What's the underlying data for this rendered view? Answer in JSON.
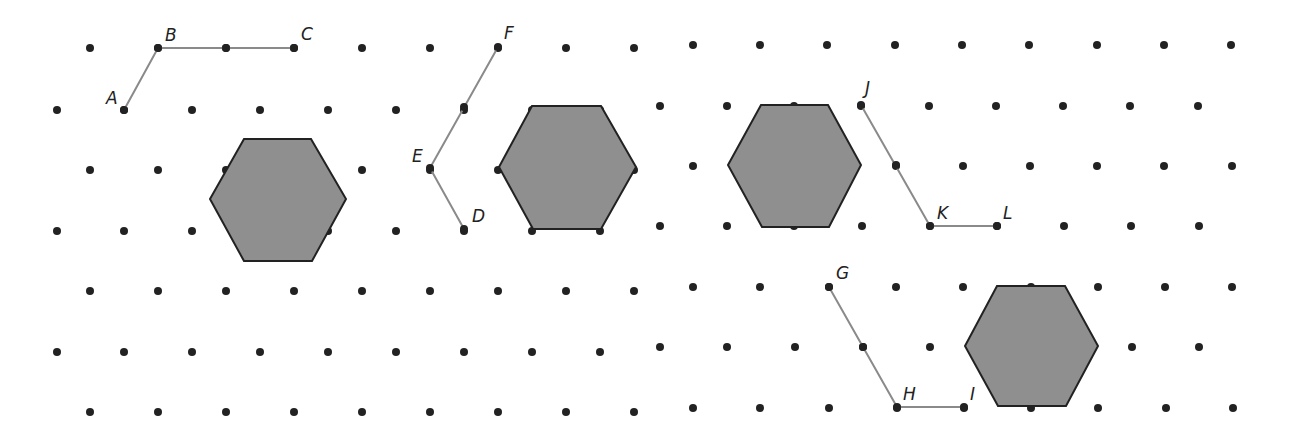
{
  "colors": {
    "dot": "#222222",
    "segment": "#8a8a8a",
    "hex_fill": "#8f8f8f",
    "hex_stroke": "#222222",
    "label": "#222222"
  },
  "panels": [
    {
      "name": "panel-left",
      "x0": 0,
      "x1": 655,
      "rows": [
        {
          "y": 48,
          "xs": [
            90,
            158,
            226,
            294,
            362,
            430,
            498,
            566,
            634
          ]
        },
        {
          "y": 110,
          "xs": [
            57,
            124,
            192,
            260,
            328,
            396,
            464,
            532,
            600
          ]
        },
        {
          "y": 170,
          "xs": [
            90,
            158,
            226,
            294,
            362,
            430,
            498,
            566,
            634
          ]
        },
        {
          "y": 231,
          "xs": [
            57,
            124,
            192,
            260,
            328,
            396,
            464,
            532,
            600
          ]
        },
        {
          "y": 291,
          "xs": [
            90,
            158,
            226,
            294,
            362,
            430,
            498,
            566,
            634
          ]
        },
        {
          "y": 352,
          "xs": [
            57,
            124,
            192,
            260,
            328,
            396,
            464,
            532,
            600
          ]
        },
        {
          "y": 412,
          "xs": [
            90,
            158,
            226,
            294,
            362,
            430,
            498,
            566,
            634
          ]
        }
      ]
    },
    {
      "name": "panel-right",
      "x0": 655,
      "x1": 1296,
      "rows": [
        {
          "y": 45,
          "xs": [
            693,
            760,
            827,
            895,
            962,
            1029,
            1097,
            1164,
            1231
          ]
        },
        {
          "y": 106,
          "xs": [
            660,
            727,
            794,
            861,
            929,
            996,
            1063,
            1130,
            1198
          ]
        },
        {
          "y": 166,
          "xs": [
            693,
            760,
            827,
            896,
            963,
            1030,
            1097,
            1164,
            1232
          ]
        },
        {
          "y": 226,
          "xs": [
            660,
            727,
            794,
            862,
            930,
            997,
            1064,
            1131,
            1199
          ]
        },
        {
          "y": 287,
          "xs": [
            693,
            760,
            829,
            896,
            963,
            1031,
            1098,
            1165,
            1232
          ]
        },
        {
          "y": 347,
          "xs": [
            660,
            727,
            795,
            863,
            930,
            998,
            1065,
            1132,
            1199
          ]
        },
        {
          "y": 408,
          "xs": [
            693,
            760,
            829,
            897,
            964,
            1031,
            1098,
            1166,
            1233
          ]
        }
      ]
    }
  ],
  "segments": [
    {
      "name": "path-abc",
      "points": [
        [
          124,
          110
        ],
        [
          158,
          48
        ],
        [
          294,
          48
        ]
      ],
      "mid_dots": [
        [
          226,
          48
        ]
      ]
    },
    {
      "name": "path-def",
      "points": [
        [
          464,
          229
        ],
        [
          430,
          168
        ],
        [
          498,
          47
        ]
      ],
      "mid_dots": [
        [
          464,
          107
        ]
      ]
    },
    {
      "name": "path-jkl",
      "points": [
        [
          861,
          105
        ],
        [
          930,
          226
        ],
        [
          997,
          226
        ]
      ],
      "mid_dots": [
        [
          896,
          165
        ]
      ]
    },
    {
      "name": "path-ghi",
      "points": [
        [
          829,
          287
        ],
        [
          897,
          407
        ],
        [
          964,
          407
        ]
      ],
      "mid_dots": [
        [
          863,
          347
        ]
      ]
    }
  ],
  "hexagons": [
    {
      "name": "hexagon-1",
      "points": [
        [
          244,
          139
        ],
        [
          311,
          139
        ],
        [
          346,
          199
        ],
        [
          312,
          261
        ],
        [
          244,
          261
        ],
        [
          210,
          199
        ]
      ]
    },
    {
      "name": "hexagon-2",
      "points": [
        [
          532,
          106
        ],
        [
          601,
          106
        ],
        [
          636,
          167
        ],
        [
          601,
          229
        ],
        [
          533,
          229
        ],
        [
          499,
          167
        ]
      ]
    },
    {
      "name": "hexagon-3",
      "points": [
        [
          761,
          105
        ],
        [
          828,
          105
        ],
        [
          861,
          165
        ],
        [
          829,
          227
        ],
        [
          762,
          227
        ],
        [
          728,
          165
        ]
      ]
    },
    {
      "name": "hexagon-4",
      "points": [
        [
          997,
          286
        ],
        [
          1065,
          286
        ],
        [
          1098,
          346
        ],
        [
          1066,
          406
        ],
        [
          998,
          406
        ],
        [
          965,
          346
        ]
      ]
    }
  ],
  "labels": [
    {
      "text": "A",
      "x": 106,
      "y": 104
    },
    {
      "text": "B",
      "x": 165,
      "y": 41
    },
    {
      "text": "C",
      "x": 301,
      "y": 40
    },
    {
      "text": "D",
      "x": 472,
      "y": 222
    },
    {
      "text": "E",
      "x": 412,
      "y": 162
    },
    {
      "text": "F",
      "x": 504,
      "y": 39
    },
    {
      "text": "G",
      "x": 836,
      "y": 279
    },
    {
      "text": "H",
      "x": 903,
      "y": 400
    },
    {
      "text": "I",
      "x": 970,
      "y": 400
    },
    {
      "text": "J",
      "x": 865,
      "y": 94
    },
    {
      "text": "K",
      "x": 937,
      "y": 219
    },
    {
      "text": "L",
      "x": 1003,
      "y": 219
    }
  ]
}
